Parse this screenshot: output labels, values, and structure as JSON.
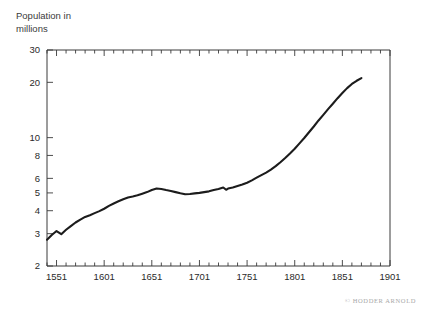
{
  "credit": "© HODDER ARNOLD",
  "chart_data": {
    "type": "line",
    "title": "",
    "ylabel_lines": [
      "Population in",
      "millions"
    ],
    "ylabel": "Population in millions",
    "xlabel": "",
    "yscale": "log",
    "xscale": "linear",
    "grid": false,
    "legend": "none",
    "xlim": [
      1541,
      1901
    ],
    "ylim": [
      2,
      30
    ],
    "ytick_values": [
      2,
      3,
      4,
      5,
      6,
      8,
      10,
      20,
      30
    ],
    "ytick_labels": [
      "2",
      "3",
      "4",
      "5",
      "6",
      "8",
      "10",
      "20",
      "30"
    ],
    "xtick_values": [
      1551,
      1601,
      1651,
      1701,
      1751,
      1801,
      1851,
      1901
    ],
    "xtick_labels": [
      "1551",
      "1601",
      "1651",
      "1701",
      "1751",
      "1801",
      "1851",
      "1901"
    ],
    "xminor_step": 10,
    "line_color": "#1c1c1c",
    "axis_color": "#3a3a3a",
    "background": "#ffffff",
    "series": [
      {
        "name": "Population of England",
        "units": "millions",
        "x": [
          1541,
          1546,
          1551,
          1556,
          1561,
          1566,
          1571,
          1576,
          1581,
          1586,
          1591,
          1596,
          1601,
          1606,
          1611,
          1616,
          1621,
          1626,
          1631,
          1636,
          1641,
          1646,
          1651,
          1656,
          1661,
          1666,
          1671,
          1676,
          1681,
          1686,
          1691,
          1696,
          1701,
          1706,
          1711,
          1716,
          1721,
          1726,
          1729,
          1731,
          1736,
          1741,
          1746,
          1751,
          1756,
          1761,
          1766,
          1771,
          1776,
          1781,
          1786,
          1791,
          1796,
          1801,
          1806,
          1811,
          1816,
          1821,
          1826,
          1831,
          1836,
          1841,
          1846,
          1851,
          1856,
          1861,
          1866,
          1871
        ],
        "values": [
          2.78,
          2.95,
          3.1,
          2.98,
          3.15,
          3.3,
          3.45,
          3.58,
          3.7,
          3.78,
          3.88,
          3.98,
          4.1,
          4.25,
          4.38,
          4.5,
          4.62,
          4.72,
          4.78,
          4.85,
          4.95,
          5.05,
          5.18,
          5.28,
          5.25,
          5.18,
          5.12,
          5.05,
          4.98,
          4.92,
          4.93,
          4.97,
          5.0,
          5.05,
          5.1,
          5.18,
          5.25,
          5.35,
          5.2,
          5.28,
          5.35,
          5.45,
          5.55,
          5.68,
          5.85,
          6.05,
          6.25,
          6.45,
          6.7,
          7.0,
          7.35,
          7.75,
          8.2,
          8.7,
          9.3,
          9.95,
          10.7,
          11.5,
          12.4,
          13.3,
          14.3,
          15.3,
          16.4,
          17.5,
          18.6,
          19.6,
          20.4,
          21.1
        ]
      }
    ]
  }
}
